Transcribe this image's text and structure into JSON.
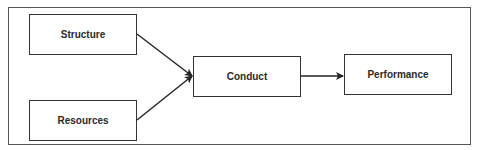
{
  "diagram": {
    "nodes": [
      {
        "id": "structure",
        "label": "Structure"
      },
      {
        "id": "resources",
        "label": "Resources"
      },
      {
        "id": "conduct",
        "label": "Conduct"
      },
      {
        "id": "performance",
        "label": "Performance"
      }
    ],
    "edges": [
      {
        "from": "structure",
        "to": "conduct"
      },
      {
        "from": "resources",
        "to": "conduct"
      },
      {
        "from": "conduct",
        "to": "performance"
      }
    ]
  }
}
